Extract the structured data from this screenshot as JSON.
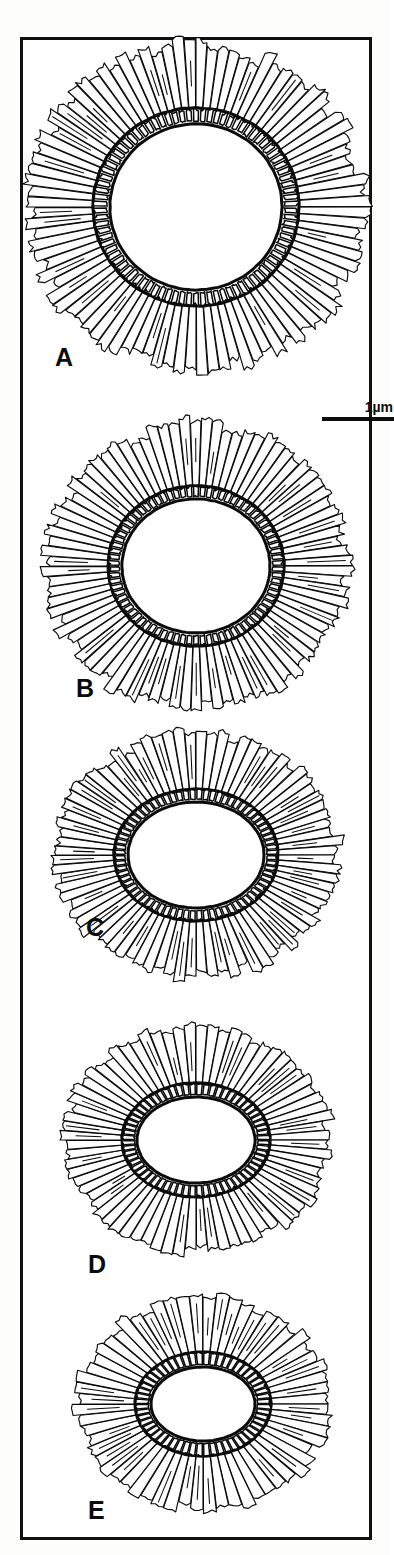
{
  "figure": {
    "kind": "scientific-line-drawing",
    "border_color": "#101010",
    "background_color": "#ffffff",
    "ink_color": "#0b0b0b"
  },
  "scalebar": {
    "label": "1µm",
    "length_px": 72,
    "position": "below-panel-a-right"
  },
  "panels": [
    {
      "label": "A",
      "label_x": 55,
      "label_y": 345,
      "cx": 196,
      "cy": 207,
      "outer_rx": 168,
      "outer_ry": 162,
      "mid_rx": 103,
      "mid_ry": 99,
      "band_rx": 88,
      "band_ry": 85,
      "lumen_rx": 86,
      "lumen_ry": 83,
      "spokes": 92,
      "band_cells": 86,
      "shape": "circular",
      "lumen": "large-round"
    },
    {
      "label": "B",
      "label_x": 76,
      "label_y": 676,
      "cx": 196,
      "cy": 566,
      "outer_rx": 150,
      "outer_ry": 142,
      "mid_rx": 88,
      "mid_ry": 80,
      "band_rx": 76,
      "band_ry": 69,
      "lumen_rx": 74,
      "lumen_ry": 67,
      "spokes": 86,
      "band_cells": 78,
      "shape": "near-circular",
      "lumen": "large-round"
    },
    {
      "label": "C",
      "label_x": 86,
      "label_y": 915,
      "cx": 196,
      "cy": 855,
      "outer_rx": 142,
      "outer_ry": 122,
      "mid_rx": 82,
      "mid_ry": 66,
      "band_rx": 70,
      "band_ry": 55,
      "lumen_rx": 68,
      "lumen_ry": 53,
      "spokes": 80,
      "band_cells": 72,
      "shape": "slightly-elliptical",
      "lumen": "oval"
    },
    {
      "label": "D",
      "label_x": 88,
      "label_y": 1252,
      "cx": 196,
      "cy": 1140,
      "outer_rx": 133,
      "outer_ry": 112,
      "mid_rx": 74,
      "mid_ry": 57,
      "band_rx": 61,
      "band_ry": 45,
      "lumen_rx": 59,
      "lumen_ry": 43,
      "spokes": 72,
      "band_cells": 64,
      "shape": "elliptical",
      "lumen": "oval-flattened"
    },
    {
      "label": "E",
      "label_x": 88,
      "label_y": 1498,
      "cx": 203,
      "cy": 1404,
      "outer_rx": 126,
      "outer_ry": 106,
      "mid_rx": 68,
      "mid_ry": 52,
      "band_rx": 54,
      "band_ry": 39,
      "lumen_rx": 52,
      "lumen_ry": 37,
      "spokes": 60,
      "band_cells": 56,
      "shape": "strongly-elliptical",
      "lumen": "small-oval"
    }
  ]
}
